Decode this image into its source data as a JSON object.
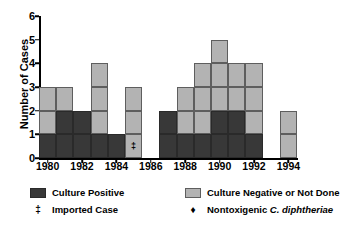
{
  "chart_data": {
    "type": "bar",
    "subtype": "stacked-bar",
    "title": "",
    "xlabel": "",
    "ylabel": "Number of Cases",
    "ylim": [
      0,
      6
    ],
    "ytick_labels": [
      "0",
      "1",
      "2",
      "3",
      "4",
      "5",
      "6"
    ],
    "categories": [
      1980,
      1981,
      1982,
      1983,
      1984,
      1985,
      1986,
      1987,
      1988,
      1989,
      1990,
      1991,
      1992,
      1993,
      1994
    ],
    "xtick_labels": [
      "1980",
      "1982",
      "1984",
      "1986",
      "1988",
      "1990",
      "1992",
      "1994"
    ],
    "xtick_values": [
      1980,
      1982,
      1984,
      1986,
      1988,
      1990,
      1992,
      1994
    ],
    "grid": false,
    "legend_position": "below",
    "series": [
      {
        "name": "Culture Positive",
        "color": "#383838",
        "values": [
          1,
          2,
          2,
          1,
          1,
          0,
          0,
          2,
          1,
          1,
          2,
          2,
          1,
          0,
          0
        ]
      },
      {
        "name": "Culture Negative or Not Done",
        "color": "#b3b3b3",
        "values": [
          2,
          1,
          0,
          3,
          0,
          3,
          0,
          0,
          2,
          3,
          3,
          2,
          3,
          0,
          2
        ]
      }
    ],
    "totals": [
      3,
      3,
      2,
      4,
      1,
      3,
      0,
      2,
      3,
      4,
      5,
      4,
      4,
      0,
      2
    ],
    "annotations": [
      {
        "year": 1985,
        "symbol": "‡",
        "meaning": "Imported Case",
        "at_value": 1
      }
    ]
  },
  "legend": {
    "row1": [
      {
        "key": "culture-positive",
        "label": "Culture Positive",
        "swatch": "pos"
      },
      {
        "key": "culture-negative",
        "label": "Culture Negative or Not Done",
        "swatch": "neg"
      }
    ],
    "row2": [
      {
        "key": "imported-case",
        "symbol": "‡",
        "label": "Imported Case"
      },
      {
        "key": "nontoxigenic",
        "symbol": "♦",
        "label_plain": "Nontoxigenic ",
        "label_italic": "C. diphtheriae"
      }
    ]
  }
}
